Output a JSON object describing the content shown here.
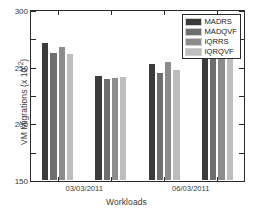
{
  "chart_data": {
    "type": "bar",
    "title": "",
    "xlabel": "Workloads",
    "ylabel": "VM Migrations (x 10-2)",
    "ylabel_base": "VM Migrations (x 10",
    "ylabel_exp": "-2",
    "ylabel_close": ")",
    "categories": [
      "03/03/2011",
      "06/03/2011",
      "09/03/2011",
      "22/03/2011"
    ],
    "series": [
      {
        "name": "MADRS",
        "color": "#3b3b3b",
        "values": [
          245,
          187,
          208,
          267
        ]
      },
      {
        "name": "MADQVF",
        "color": "#6e6e6e",
        "values": [
          227,
          181,
          193,
          250
        ]
      },
      {
        "name": "IQRRS",
        "color": "#8c8c8c",
        "values": [
          239,
          184,
          212,
          268
        ]
      },
      {
        "name": "IQRQVF",
        "color": "#bdbdbd",
        "values": [
          226,
          185,
          197,
          252
        ]
      }
    ],
    "ylim": [
      0,
      300
    ],
    "yticks": [
      0,
      50,
      100,
      150,
      200,
      250,
      300
    ],
    "ytick_labels": [
      "0",
      "50",
      "100",
      "150",
      "200",
      "250",
      "300"
    ],
    "grid": false,
    "legend_position": "top-right",
    "axis_color": "#2b2b2b",
    "background": "#ffffff"
  },
  "legend": {
    "items": [
      {
        "label": "MADRS"
      },
      {
        "label": "MADQVF"
      },
      {
        "label": "IQRRS"
      },
      {
        "label": "IQRQVF"
      }
    ]
  }
}
